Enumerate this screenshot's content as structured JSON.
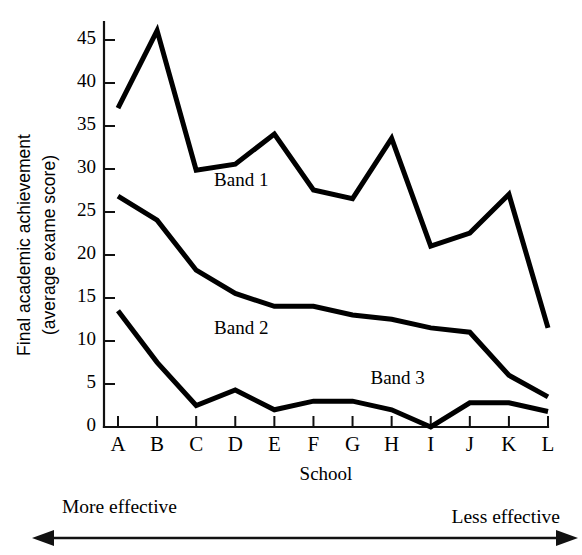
{
  "chart_data": {
    "type": "line",
    "title": "",
    "xlabel": "School",
    "ylabel": "Final academic achievement (average exame score)",
    "ylabel_line1": "Final academic achievement",
    "ylabel_line2": "(average exame score)",
    "categories": [
      "A",
      "B",
      "C",
      "D",
      "E",
      "F",
      "G",
      "H",
      "I",
      "J",
      "K",
      "L"
    ],
    "ylim": [
      0,
      47
    ],
    "yticks": [
      0,
      5,
      10,
      15,
      20,
      25,
      30,
      35,
      40,
      45
    ],
    "ytick_labels": [
      "0",
      "5",
      "10",
      "15",
      "20",
      "25",
      "30",
      "35",
      "40",
      "45"
    ],
    "grid": false,
    "legend_position": "inline-annotations",
    "series": [
      {
        "name": "Band 1",
        "values": [
          37,
          46,
          29.8,
          30.5,
          34,
          27.5,
          26.5,
          33.5,
          21,
          22.5,
          27,
          11.5
        ]
      },
      {
        "name": "Band 2",
        "values": [
          26.8,
          24,
          18.2,
          15.5,
          14,
          14,
          13,
          12.5,
          11.5,
          11,
          6,
          3.5
        ]
      },
      {
        "name": "Band 3",
        "values": [
          13.5,
          7.5,
          2.5,
          4.3,
          2,
          3,
          3,
          2,
          0,
          2.8,
          2.8,
          1.8
        ]
      }
    ],
    "annotations": [
      {
        "id": "band-1-label",
        "text": "Band 1",
        "x_category": "D",
        "y_value": 28.0
      },
      {
        "id": "band-2-label",
        "text": "Band 2",
        "x_category": "D",
        "y_value": 10.8
      },
      {
        "id": "band-3-label",
        "text": "Band 3",
        "x_category": "H",
        "y_value": 5.0
      }
    ],
    "direction_axis": {
      "left_label": "More effective",
      "right_label": "Less effective",
      "arrow": "double-headed"
    }
  }
}
